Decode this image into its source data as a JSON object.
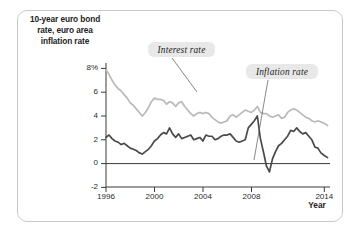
{
  "figure": {
    "title": "10-year euro bond rate, euro area inflation rate",
    "title_lines": [
      "10-year euro bond",
      "rate, euro area",
      "inflation rate"
    ],
    "xaxis_title": "Year"
  },
  "callouts": {
    "interest": "Interest rate",
    "inflation": "Inflation rate"
  },
  "axis": {
    "y_ticks": [
      "8%",
      "6",
      "4",
      "2",
      "0",
      "-2"
    ],
    "x_ticks": [
      "1996",
      "2000",
      "2004",
      "2008",
      "2014"
    ]
  },
  "colors": {
    "interest_line": "#b9b9b9",
    "inflation_line": "#4a4a4a",
    "axis": "#3a3a3a",
    "frame": "#c9c9c9",
    "callout_bg": "#e8e8e8"
  },
  "chart_data": {
    "type": "line",
    "title": "10-year euro bond rate, euro area inflation rate",
    "xlabel": "Year",
    "ylabel": "10-year euro bond rate, euro area inflation rate",
    "xlim": [
      1996,
      2014.5
    ],
    "ylim": [
      -2,
      8
    ],
    "yticks": [
      -2,
      0,
      2,
      4,
      6,
      8
    ],
    "xticks": [
      1996,
      2000,
      2004,
      2008,
      2014
    ],
    "grid": false,
    "legend": "inline annotations",
    "annotations": [
      {
        "text": "Interest rate",
        "points_to_year": 2003.6,
        "points_to_value": 5.2
      },
      {
        "text": "Inflation rate",
        "points_to_year": 2009.0,
        "points_to_value": 0.3
      }
    ],
    "series": [
      {
        "name": "Interest rate",
        "color": "#b9b9b9",
        "x": [
          1996.0,
          1996.25,
          1996.5,
          1996.75,
          1997.0,
          1997.25,
          1997.5,
          1997.75,
          1998.0,
          1998.25,
          1998.5,
          1998.75,
          1999.0,
          1999.25,
          1999.5,
          1999.75,
          2000.0,
          2000.25,
          2000.5,
          2000.75,
          2001.0,
          2001.25,
          2001.5,
          2001.75,
          2002.0,
          2002.25,
          2002.5,
          2002.75,
          2003.0,
          2003.25,
          2003.5,
          2003.75,
          2004.0,
          2004.25,
          2004.5,
          2004.75,
          2005.0,
          2005.25,
          2005.5,
          2005.75,
          2006.0,
          2006.25,
          2006.5,
          2006.75,
          2007.0,
          2007.25,
          2007.5,
          2007.75,
          2008.0,
          2008.25,
          2008.5,
          2008.75,
          2009.0,
          2009.25,
          2009.5,
          2009.75,
          2010.0,
          2010.25,
          2010.5,
          2010.75,
          2011.0,
          2011.25,
          2011.5,
          2011.75,
          2012.0,
          2012.25,
          2012.5,
          2012.75,
          2013.0,
          2013.25,
          2013.5,
          2013.75,
          2014.0,
          2014.3
        ],
        "y": [
          7.9,
          7.5,
          7.0,
          6.6,
          6.3,
          6.1,
          5.8,
          5.5,
          5.1,
          4.9,
          4.6,
          4.3,
          4.0,
          4.3,
          4.7,
          5.2,
          5.5,
          5.4,
          5.4,
          5.3,
          5.0,
          5.2,
          5.1,
          4.8,
          5.1,
          5.2,
          4.8,
          4.5,
          4.2,
          4.0,
          4.2,
          4.3,
          4.2,
          4.3,
          4.2,
          3.9,
          3.7,
          3.5,
          3.4,
          3.5,
          3.6,
          4.0,
          4.1,
          3.9,
          4.1,
          4.3,
          4.5,
          4.4,
          4.3,
          4.5,
          4.8,
          4.3,
          4.2,
          4.2,
          4.0,
          3.9,
          4.0,
          4.1,
          3.8,
          3.9,
          4.3,
          4.5,
          4.6,
          4.5,
          4.3,
          4.1,
          3.9,
          3.8,
          3.6,
          3.5,
          3.6,
          3.5,
          3.4,
          3.2
        ]
      },
      {
        "name": "Inflation rate",
        "color": "#4a4a4a",
        "x": [
          1996.0,
          1996.25,
          1996.5,
          1996.75,
          1997.0,
          1997.25,
          1997.5,
          1997.75,
          1998.0,
          1998.25,
          1998.5,
          1998.75,
          1999.0,
          1999.25,
          1999.5,
          1999.75,
          2000.0,
          2000.25,
          2000.5,
          2000.75,
          2001.0,
          2001.25,
          2001.5,
          2001.75,
          2002.0,
          2002.25,
          2002.5,
          2002.75,
          2003.0,
          2003.25,
          2003.5,
          2003.75,
          2004.0,
          2004.25,
          2004.5,
          2004.75,
          2005.0,
          2005.25,
          2005.5,
          2005.75,
          2006.0,
          2006.25,
          2006.5,
          2006.75,
          2007.0,
          2007.25,
          2007.5,
          2007.75,
          2008.0,
          2008.25,
          2008.5,
          2008.75,
          2009.0,
          2009.25,
          2009.5,
          2009.75,
          2010.0,
          2010.25,
          2010.5,
          2010.75,
          2011.0,
          2011.25,
          2011.5,
          2011.75,
          2012.0,
          2012.25,
          2012.5,
          2012.75,
          2013.0,
          2013.25,
          2013.5,
          2013.75,
          2014.0,
          2014.3
        ],
        "y": [
          2.2,
          2.4,
          2.1,
          1.9,
          1.8,
          1.6,
          1.7,
          1.5,
          1.3,
          1.2,
          1.1,
          0.9,
          0.8,
          1.0,
          1.2,
          1.5,
          1.9,
          2.1,
          2.4,
          2.6,
          2.5,
          3.0,
          2.5,
          2.2,
          2.5,
          2.1,
          2.2,
          2.3,
          2.4,
          2.0,
          2.1,
          2.2,
          1.9,
          2.4,
          2.3,
          2.3,
          2.0,
          2.1,
          2.3,
          2.4,
          2.4,
          2.5,
          2.2,
          1.9,
          1.8,
          1.9,
          2.0,
          3.0,
          3.3,
          3.6,
          4.0,
          2.1,
          1.0,
          -0.2,
          -0.7,
          0.4,
          1.0,
          1.5,
          1.7,
          2.0,
          2.3,
          2.8,
          2.7,
          3.0,
          2.7,
          2.5,
          2.6,
          2.3,
          2.0,
          1.4,
          1.3,
          0.9,
          0.7,
          0.5
        ]
      }
    ]
  }
}
